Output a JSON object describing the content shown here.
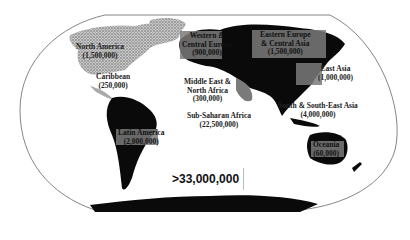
{
  "map": {
    "title": "",
    "projection": "Winkel-style world outline",
    "total_label": ">33,000,000",
    "colors": {
      "land_dark": "#0a0a0a",
      "land_stipple": "#9a9a9a",
      "highlight_box": "#7a7a7a",
      "outline": "#555555",
      "background": "#ffffff"
    },
    "regions": [
      {
        "name": "North America",
        "value": "(1,500,000)"
      },
      {
        "name": "Caribbean",
        "value": "(250,000)"
      },
      {
        "name": "Latin America",
        "value": "(2,000,000)"
      },
      {
        "name": "Western & Central Europe",
        "name_line1": "Western &",
        "name_line2": "Central Europe",
        "value": "(900,000)"
      },
      {
        "name": "Eastern Europe & Central Asia",
        "name_line1": "Eastern Europe",
        "name_line2": "& Central Asia",
        "value": "(1,500,000)"
      },
      {
        "name": "Middle East & North Africa",
        "name_line1": "Middle East &",
        "name_line2": "North Africa",
        "value": "(300,000)"
      },
      {
        "name": "Sub-Saharan Africa",
        "value": "(22,500,000)"
      },
      {
        "name": "East Asia",
        "value": "(1,000,000)"
      },
      {
        "name": "South & South-East Asia",
        "value": "(4,000,000)"
      },
      {
        "name": "Oceania",
        "value": "(60,000)"
      }
    ]
  }
}
